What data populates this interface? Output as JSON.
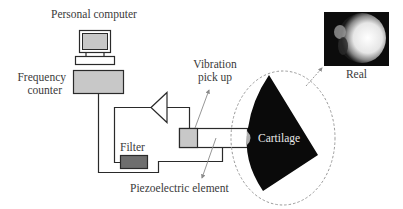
{
  "diagram": {
    "labels": {
      "personal_computer": "Personal computer",
      "frequency_counter_line1": "Frequency",
      "frequency_counter_line2": "counter",
      "vibration_pickup_line1": "Vibration",
      "vibration_pickup_line2": "pick up",
      "filter": "Filter",
      "piezoelectric_element": "Piezoelectric element",
      "cartilage": "Cartilage",
      "real": "Real"
    },
    "colors": {
      "line": "#2a2a2a",
      "box_fill_light": "#c8c8c8",
      "box_fill_dark": "#6e6e6e",
      "cartilage_fill": "#0a0a0a",
      "ellipse_dash": "#9a9a9a",
      "arrow": "#8a8a8a"
    },
    "components": [
      "personal-computer",
      "frequency-counter",
      "amplifier",
      "filter",
      "vibration-pickup",
      "piezoelectric-rod",
      "cartilage-sample",
      "real-image"
    ]
  }
}
